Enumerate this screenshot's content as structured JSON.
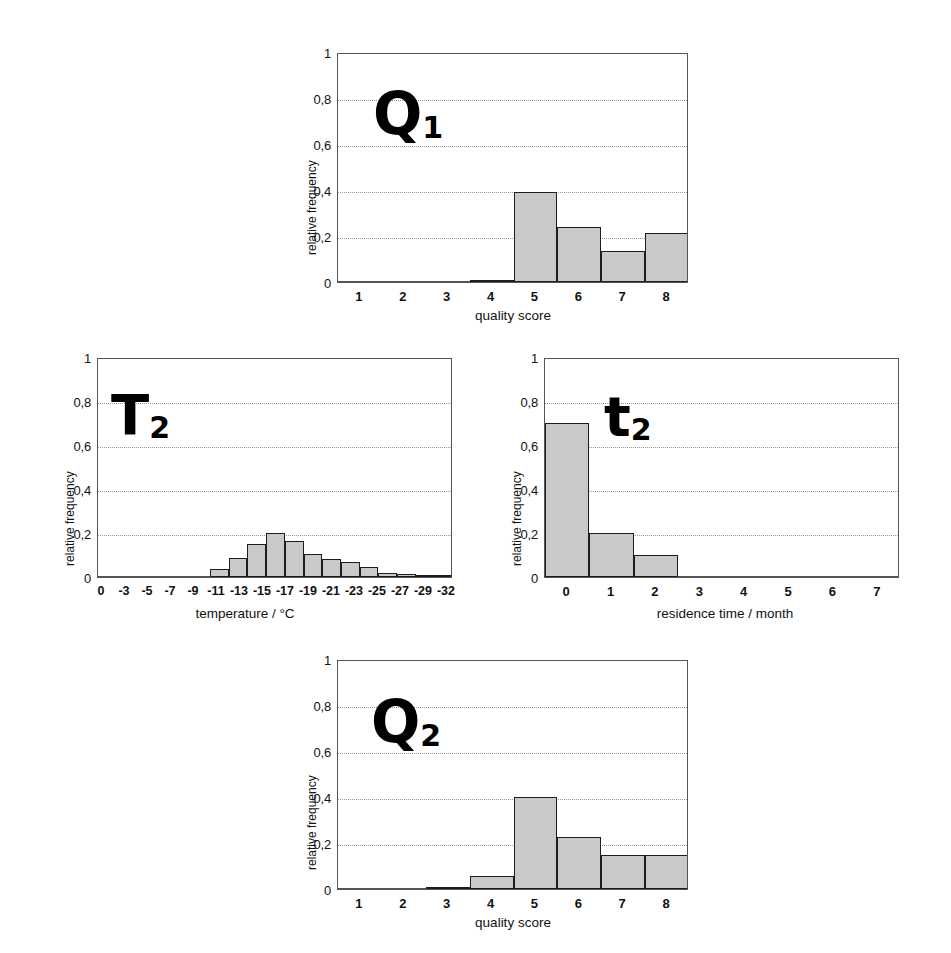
{
  "figure": {
    "bar_fill_color": "#c9c9c9",
    "bar_edge_color": "#1d1d1d",
    "grid_color": "#9a9a9a",
    "axis_color": "#555555"
  },
  "chart_data": [
    {
      "id": "q1",
      "type": "bar",
      "title": "",
      "tag_base": "Q",
      "tag_sub": "1",
      "xlabel": "quality score",
      "ylabel": "relative frequency",
      "ylim": [
        0,
        1
      ],
      "yticks": [
        0,
        0.2,
        0.4,
        0.6,
        0.8,
        1
      ],
      "ytick_labels": [
        "0",
        "0,2",
        "0,4",
        "0,6",
        "0,8",
        "1"
      ],
      "xlim": [
        0.5,
        8.5
      ],
      "xticks": [
        1,
        2,
        3,
        4,
        5,
        6,
        7,
        8
      ],
      "xtick_labels": [
        "1",
        "2",
        "3",
        "4",
        "5",
        "6",
        "7",
        "8"
      ],
      "grid": true,
      "categories": [
        1,
        2,
        3,
        4,
        5,
        6,
        7,
        8
      ],
      "values": [
        0,
        0,
        0,
        0.005,
        0.39,
        0.24,
        0.135,
        0.215
      ]
    },
    {
      "id": "t2_temperature",
      "type": "bar",
      "title": "",
      "tag_base": "T",
      "tag_sub": "2",
      "xlabel": "temperature / °C",
      "ylabel": "relative frequency",
      "ylim": [
        0,
        1
      ],
      "yticks": [
        0,
        0.2,
        0.4,
        0.6,
        0.8,
        1
      ],
      "ytick_labels": [
        "0",
        "0,2",
        "0,4",
        "0,6",
        "0,8",
        "1"
      ],
      "xtick_labels": [
        "0",
        "-3",
        "-5",
        "-7",
        "-9",
        "-11",
        "-13",
        "-15",
        "-17",
        "-19",
        "-21",
        "-23",
        "-25",
        "-27",
        "-29",
        "-32"
      ],
      "grid": true,
      "categories": [
        "0",
        "-3",
        "-5",
        "-7",
        "-9",
        "-11",
        "-13",
        "-15",
        "-17",
        "-19",
        "-21",
        "-23",
        "-25",
        "-27",
        "-29",
        "-32"
      ],
      "values": [
        0,
        0,
        0,
        0,
        0,
        0,
        0.035,
        0.085,
        0.15,
        0.2,
        0.165,
        0.105,
        0.08,
        0.07,
        0.045,
        0.02,
        0.012,
        0.01,
        0.005
      ]
    },
    {
      "id": "t2_residence",
      "type": "bar",
      "title": "",
      "tag_base": "t",
      "tag_sub": "2",
      "xlabel": "residence time / month",
      "ylabel": "relative frequency",
      "ylim": [
        0,
        1
      ],
      "yticks": [
        0,
        0.2,
        0.4,
        0.6,
        0.8,
        1
      ],
      "ytick_labels": [
        "0",
        "0,2",
        "0,4",
        "0,6",
        "0,8",
        "1"
      ],
      "xlim": [
        -0.5,
        7.5
      ],
      "xticks": [
        0,
        1,
        2,
        3,
        4,
        5,
        6,
        7
      ],
      "xtick_labels": [
        "0",
        "1",
        "2",
        "3",
        "4",
        "5",
        "6",
        "7"
      ],
      "grid": true,
      "categories": [
        0,
        1,
        2,
        3,
        4,
        5,
        6,
        7
      ],
      "values": [
        0.7,
        0.2,
        0.1,
        0,
        0,
        0,
        0,
        0
      ]
    },
    {
      "id": "q2",
      "type": "bar",
      "title": "",
      "tag_base": "Q",
      "tag_sub": "2",
      "xlabel": "quality score",
      "ylabel": "relative frequency",
      "ylim": [
        0,
        1
      ],
      "yticks": [
        0,
        0.2,
        0.4,
        0.6,
        0.8,
        1
      ],
      "ytick_labels": [
        "0",
        "0,2",
        "0,4",
        "0,6",
        "0,8",
        "1"
      ],
      "xlim": [
        0.5,
        8.5
      ],
      "xticks": [
        1,
        2,
        3,
        4,
        5,
        6,
        7,
        8
      ],
      "xtick_labels": [
        "1",
        "2",
        "3",
        "4",
        "5",
        "6",
        "7",
        "8"
      ],
      "grid": true,
      "categories": [
        1,
        2,
        3,
        4,
        5,
        6,
        7,
        8
      ],
      "values": [
        0,
        0,
        0.005,
        0.055,
        0.4,
        0.225,
        0.15,
        0.15
      ]
    }
  ]
}
